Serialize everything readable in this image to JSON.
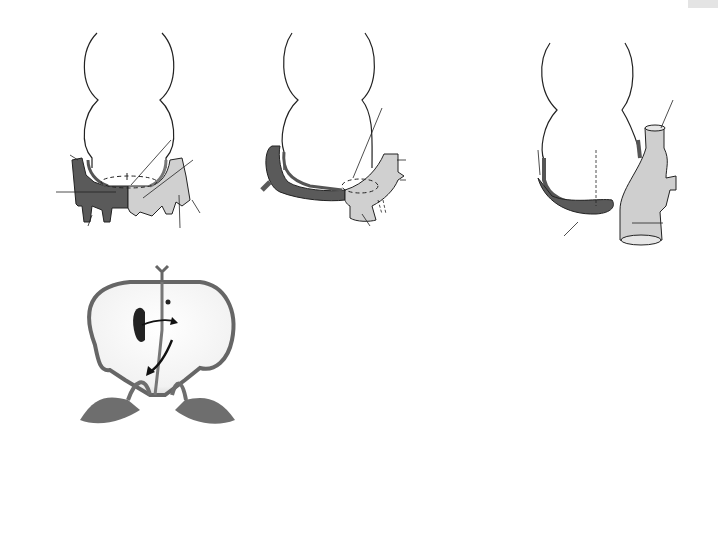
{
  "figure": {
    "page_tab": "",
    "panels": {
      "A": {
        "letter": "A",
        "labels": {
          "ventricle": "Ventricle",
          "atrium": "Atrium",
          "junction_1": "Junction:",
          "junction_2": "sinus venosus",
          "junction_3": "and atrium",
          "anterior_1": "Anterior",
          "anterior_2": "cardinal",
          "anterior_3": "vein",
          "right_horn_1": "Right",
          "right_horn_2": "sinus",
          "right_horn_3": "horn",
          "left_horn_1": "Left",
          "left_horn_2": "sinus",
          "left_horn_3": "horn",
          "posterior_1": "Posterior",
          "posterior_2": "cardinal",
          "posterior_3": "vein",
          "umbilical_1": "Umbilical",
          "umbilical_2": "vein",
          "vitelline_1": "Vitelline",
          "vitelline_2": "vein",
          "common_1": "Common",
          "common_2": "cardinal vein"
        }
      },
      "B": {
        "letter": "B",
        "labels": {
          "ventricle": "Ventricle",
          "atrium": "Atrium",
          "junction_1": "Junction:",
          "junction_2": "sinus venosus",
          "junction_3": "and atrium",
          "anterior_1": "Anterior",
          "anterior_2": "cardinal vein",
          "posterior_1": "Posterior",
          "posterior_2": "cardinal vein",
          "vitelline_1": "Right vitelline",
          "vitelline_2": "vein"
        }
      },
      "C": {
        "letter": "C",
        "labels": {
          "ventricle": "Ventricle",
          "atrium": "Atrium",
          "svc_1": "Superior",
          "svc_2": "vena",
          "svc_3": "cava",
          "oblique_1": "Oblique",
          "oblique_2": "vein of",
          "oblique_3": "left atrium",
          "septum_1": "Developing",
          "septum_2": "atrial",
          "septum_3": "septum",
          "ivc_1": "Inferior",
          "ivc_2": "vena",
          "ivc_3": "cava",
          "coronary_1": "Coronary",
          "coronary_2": "sinus"
        }
      },
      "D": {
        "letter": "D",
        "labels": {
          "pulmonary_1": "Pulmonary",
          "pulmonary_2": "veins",
          "right_valve_1": "Right venous",
          "right_valve_2": "valve",
          "sinuatrial_1": "Sinuatrial",
          "sinuatrial_2": "orifice",
          "left_valve_1": "Left venous",
          "left_valve_2": "valve",
          "ra": "RA",
          "la": "LA"
        }
      },
      "E": {
        "letter": "E",
        "labels": {
          "svc": "Superior vena cava",
          "sinus_1": "Sinus",
          "sinus_2": "venarum",
          "crista_1": "Crista",
          "crista_2": "terminalis",
          "openings_1": "Openings",
          "openings_2": "of pulmonary",
          "openings_3": "veins",
          "trab_right_1": "Trabeculated",
          "trab_right_2": "portion of the",
          "trab_right_3": "right atrium",
          "trab_left_1": "Trabeculated",
          "trab_left_2": "portion of the",
          "trab_left_3": "left atrium",
          "ivc_valve_1": "Valve of",
          "ivc_valve_2": "inferior",
          "ivc_valve_3": "vena cava",
          "coronary_valve": "Valve of coronary sinus",
          "smooth_1": "Smooth-walled",
          "smooth_2": "portion of the",
          "smooth_3": "left atrium",
          "ivc_open_1": "Opening of",
          "ivc_open_2": "the inferior",
          "ivc_open_3": "vena cava",
          "ra": "RA",
          "la": "LA"
        }
      },
      "F": {
        "letter": "F",
        "labels": {
          "svc_1": "Superior",
          "svc_2": "vena cava",
          "aorta": "Aorta",
          "pulm_artery": "Pulmonary artery",
          "oblique_1": "Oblique vein",
          "oblique_2": "of left atrium",
          "pulm_veins_1": "Pulmonary",
          "pulm_veins_2": "veins",
          "left_v_1": "Left",
          "left_v_2": "ventricle",
          "ivc_1": "Inferior",
          "ivc_2": "vena cava",
          "coronary": "Coronary sinus",
          "right_v_1": "Right",
          "right_v_2": "ventricle"
        }
      }
    },
    "colors": {
      "dark_vessel": "#5a5a5a",
      "light_vessel": "#cfcfcf",
      "outline": "#222222",
      "wall": "#6e6e6e"
    }
  }
}
